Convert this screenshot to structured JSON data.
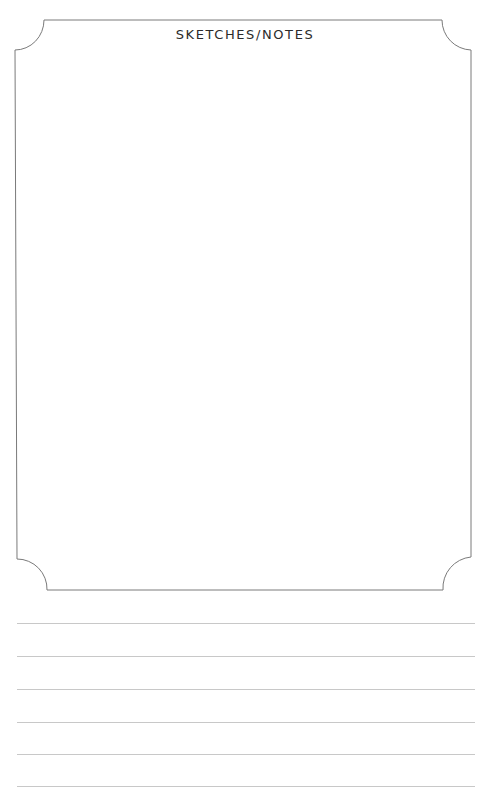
{
  "page": {
    "title": "SKETCHES/NOTES"
  },
  "sketch_frame": {
    "stroke_color": "#7a7a7a",
    "corner_style": "inverted-rounded-notch"
  },
  "ruled_lines": {
    "count": 6,
    "color": "#c8c8c8",
    "positions_y": [
      623,
      656,
      689,
      722,
      754,
      786
    ]
  }
}
